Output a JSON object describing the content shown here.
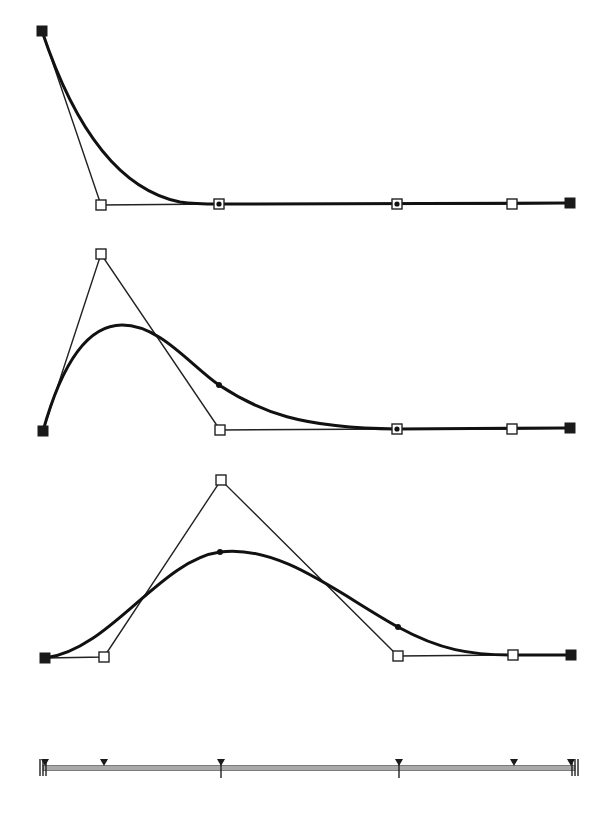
{
  "figure": {
    "colors": {
      "curve": "#111111",
      "polygon": "#222222",
      "endpoint": "#1a1a1a",
      "knot_bar": "#a9a9a9"
    }
  },
  "graphs": [
    {
      "name": "graph-1",
      "control_points": [
        {
          "x": 42,
          "y": 31,
          "type": "black"
        },
        {
          "x": 101,
          "y": 205,
          "type": "white"
        },
        {
          "x": 219,
          "y": 204,
          "type": "target"
        },
        {
          "x": 397,
          "y": 204,
          "type": "target"
        },
        {
          "x": 512,
          "y": 204,
          "type": "white"
        },
        {
          "x": 570,
          "y": 203,
          "type": "black"
        }
      ],
      "curve_path": "M42,31 C75,130 120,190 180,202 C200,205 215,204 240,204 L570,203",
      "knot_dots": []
    },
    {
      "name": "graph-2",
      "control_points": [
        {
          "x": 43,
          "y": 431,
          "type": "black"
        },
        {
          "x": 101,
          "y": 254,
          "type": "white"
        },
        {
          "x": 220,
          "y": 430,
          "type": "white"
        },
        {
          "x": 397,
          "y": 429,
          "type": "target"
        },
        {
          "x": 512,
          "y": 429,
          "type": "white"
        },
        {
          "x": 570,
          "y": 428,
          "type": "black"
        }
      ],
      "curve_path": "M43,431 C60,370 85,325 122,325 C160,325 190,365 219,385 C260,412 300,428 397,429 L570,428",
      "knot_dots": [
        {
          "x": 219,
          "y": 385
        }
      ]
    },
    {
      "name": "graph-3",
      "control_points": [
        {
          "x": 45,
          "y": 658,
          "type": "black"
        },
        {
          "x": 104,
          "y": 657,
          "type": "white"
        },
        {
          "x": 221,
          "y": 480,
          "type": "white"
        },
        {
          "x": 398,
          "y": 656,
          "type": "white"
        },
        {
          "x": 513,
          "y": 655,
          "type": "white"
        },
        {
          "x": 571,
          "y": 655,
          "type": "black"
        }
      ],
      "curve_path": "M45,658 C110,650 160,560 220,552 C280,544 340,595 398,627 C440,650 470,655 513,655 L571,655",
      "knot_dots": [
        {
          "x": 220,
          "y": 552
        },
        {
          "x": 398,
          "y": 627
        }
      ]
    }
  ],
  "knot_bar": {
    "y": 768,
    "x_start": 43,
    "x_end": 575,
    "end_ticks_left": [
      40,
      43,
      46
    ],
    "end_ticks_right": [
      572,
      575,
      578
    ],
    "triangles": [
      45,
      104,
      221,
      399,
      514,
      571
    ],
    "inner_ticks": [
      221,
      399
    ]
  }
}
